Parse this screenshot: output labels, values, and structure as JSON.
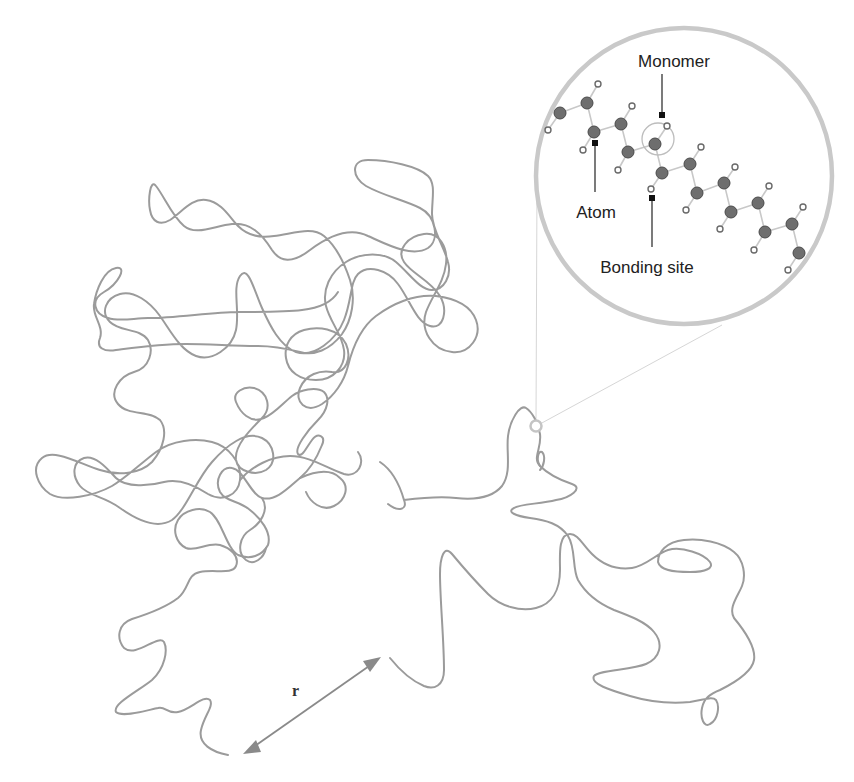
{
  "diagram": {
    "labels": {
      "monomer": "Monomer",
      "atom": "Atom",
      "bonding_site": "Bonding site",
      "end_to_end": "r"
    },
    "colors": {
      "chain": "#9b9b9b",
      "zoom_circle": "#c9c9c9",
      "atom": "#6e6e6e",
      "marker": "#111111"
    },
    "elements": {
      "chain": "random-coil polymer chain",
      "magnifier": "zoomed-in view of chain segment",
      "end_to_end_vector": "double-headed arrow between chain ends"
    }
  }
}
